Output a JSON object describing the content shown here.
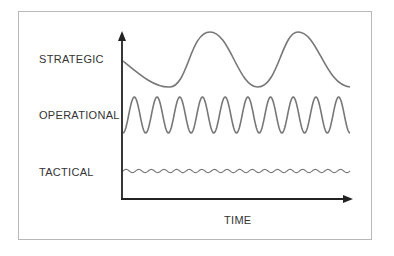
{
  "diagram": {
    "rows": [
      {
        "id": "strategic",
        "label": "STRATEGIC",
        "wave": "low-frequency, high-amplitude",
        "peaks": 2
      },
      {
        "id": "operational",
        "label": "OPERATIONAL",
        "wave": "medium-frequency, medium-amplitude",
        "peaks": 10
      },
      {
        "id": "tactical",
        "label": "TACTICAL",
        "wave": "high-frequency, low-amplitude",
        "peaks": 18
      }
    ],
    "x_axis": {
      "label": "TIME"
    },
    "colors": {
      "axis": "#222222",
      "curve": "#777777",
      "frame": "#b8b8b8",
      "text": "#333333"
    }
  }
}
